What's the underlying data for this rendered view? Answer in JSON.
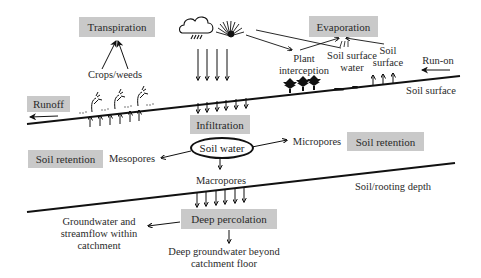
{
  "diagram": {
    "type": "soil water balance flow diagram",
    "boxes": {
      "transpiration": "Transpiration",
      "evaporation": "Evaporation",
      "runoff": "Runoff",
      "infiltration": "Infiltration",
      "soil_retention_left": "Soil retention",
      "soil_retention_right": "Soil retention",
      "deep_percolation": "Deep percolation"
    },
    "central_node": "Soil water",
    "labels": {
      "crops_weeds": "Crops/weeds",
      "plant_interception": "Plant\ninterception",
      "soil_surface_water": "Soil surface\nwater",
      "soil_surface_evap": "Soil\nsurface",
      "run_on": "Run-on",
      "soil_surface_line": "Soil surface",
      "mesopores": "Mesopores",
      "micropores": "Micropores",
      "macropores": "Macropores",
      "soil_rooting_depth": "Soil/rooting depth",
      "groundwater_within": "Groundwater and\nstreamflow within\ncatchment",
      "deep_groundwater_beyond": "Deep groundwater beyond\ncatchment floor"
    },
    "icons": [
      "cloud-rain-icon",
      "sprinkler-irrigation-icon",
      "crop-plant-icon",
      "tree-icon",
      "puddle-icon"
    ],
    "colors": {
      "box_fill": "#c9c9c9",
      "line": "#111111",
      "background": "#ffffff"
    }
  }
}
